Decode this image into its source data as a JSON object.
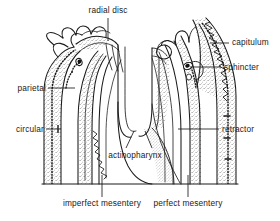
{
  "figure": {
    "style": {
      "ink": "#1a1a1a",
      "stipple_fill": "#e8e8e8",
      "background": "#ffffff",
      "line_width": 1.0
    }
  },
  "labels": [
    {
      "id": "radial-disc",
      "text": "radial disc",
      "align": "center",
      "x": 78,
      "y": 6,
      "leader": {
        "x1": 108,
        "y1": 18,
        "x2": 108,
        "y2": 41
      }
    },
    {
      "id": "capitulum",
      "text": "capitulum",
      "align": "left",
      "x": 232,
      "y": 37,
      "leader": {
        "x1": 210,
        "y1": 43,
        "x2": 229,
        "y2": 43
      }
    },
    {
      "id": "sphincter",
      "text": "sphincter",
      "align": "left",
      "x": 224,
      "y": 62,
      "leader": {
        "x1": 190,
        "y1": 67,
        "x2": 221,
        "y2": 67
      }
    },
    {
      "id": "parietal",
      "text": "parietal",
      "align": "right",
      "x": 14,
      "y": 83,
      "leader": {
        "x1": 48,
        "y1": 88,
        "x2": 75,
        "y2": 88
      }
    },
    {
      "id": "circular",
      "text": "circular",
      "align": "right",
      "x": 11,
      "y": 124,
      "leader": {
        "x1": 46,
        "y1": 129,
        "x2": 61,
        "y2": 129
      }
    },
    {
      "id": "retractor",
      "text": "retractor",
      "align": "left",
      "x": 222,
      "y": 124,
      "leader": {
        "x1": 178,
        "y1": 129,
        "x2": 219,
        "y2": 129
      }
    },
    {
      "id": "actinopharynx",
      "text": "actinopharynx",
      "align": "center",
      "x": 100,
      "y": 152,
      "leader": null
    },
    {
      "id": "imperfect-mesentery",
      "text": "imperfect mesentery",
      "align": "center",
      "x": 56,
      "y": 200,
      "leader": {
        "x1": 102,
        "y1": 175,
        "x2": 102,
        "y2": 197
      }
    },
    {
      "id": "perfect-mesentery",
      "text": "perfect mesentery",
      "align": "center",
      "x": 145,
      "y": 200,
      "leader": {
        "x1": 188,
        "y1": 175,
        "x2": 188,
        "y2": 197
      }
    }
  ],
  "actinopharynx_leaders": [
    {
      "x1": 126,
      "y1": 148,
      "x2": 134,
      "y2": 131
    },
    {
      "x1": 152,
      "y1": 148,
      "x2": 145,
      "y2": 131
    }
  ],
  "anatomy": {
    "parts": [
      "radial disc",
      "capitulum",
      "sphincter",
      "parietal muscle",
      "circular muscle",
      "retractor muscle",
      "actinopharynx",
      "imperfect mesentery",
      "perfect mesentery",
      "tentacles",
      "pedal disc"
    ]
  }
}
